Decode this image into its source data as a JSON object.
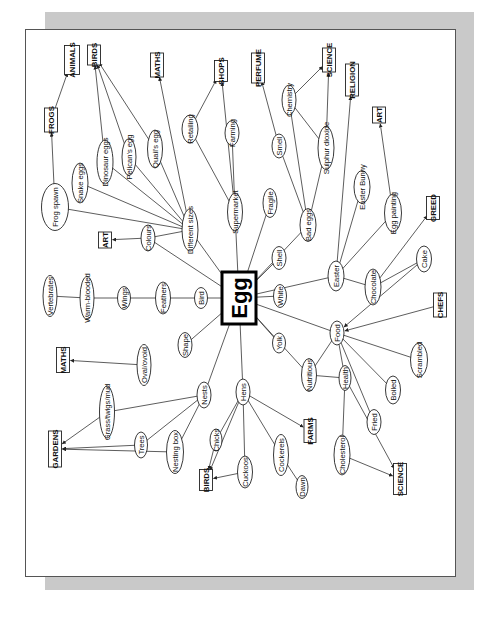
{
  "diagram": {
    "type": "mind-map",
    "orientation": "rotated-90-ccw",
    "central": {
      "id": "egg",
      "label": "Egg"
    },
    "colors": {
      "shadow": "#c9c9c9",
      "panel": "#ffffff",
      "line": "#333333",
      "ink": "#111111"
    },
    "concepts": [
      {
        "id": "frog_spawn",
        "label": "Frog spawn"
      },
      {
        "id": "snake_eggs",
        "label": "Snake eggs"
      },
      {
        "id": "dinosaur_eggs",
        "label": "Dinosaur eggs"
      },
      {
        "id": "pelicans_egg",
        "label": "Pelican's egg"
      },
      {
        "id": "quails_egg",
        "label": "Quail's egg"
      },
      {
        "id": "retailing",
        "label": "Retailing"
      },
      {
        "id": "farming",
        "label": "Farming"
      },
      {
        "id": "smell",
        "label": "Smell"
      },
      {
        "id": "chemistry",
        "label": "Chemistry"
      },
      {
        "id": "sulphur_dioxide",
        "label": "Sulphur dioxide"
      },
      {
        "id": "easter_bunny",
        "label": "Easter Bunny"
      },
      {
        "id": "egg_painting",
        "label": "Egg painting"
      },
      {
        "id": "different_sizes",
        "label": "Different sizes"
      },
      {
        "id": "supermarket",
        "label": "Supermarket"
      },
      {
        "id": "fragile",
        "label": "Fragile"
      },
      {
        "id": "bad_eggs",
        "label": "Bad eggs"
      },
      {
        "id": "colours",
        "label": "Colours"
      },
      {
        "id": "shell",
        "label": "Shell"
      },
      {
        "id": "easter",
        "label": "Easter"
      },
      {
        "id": "chocolate",
        "label": "Chocolate"
      },
      {
        "id": "cake",
        "label": "Cake"
      },
      {
        "id": "vertebrates",
        "label": "Vertebrates"
      },
      {
        "id": "warm_blooded",
        "label": "Warm-blooded"
      },
      {
        "id": "wings",
        "label": "Wings"
      },
      {
        "id": "feathers",
        "label": "Feathers"
      },
      {
        "id": "bird",
        "label": "Bird"
      },
      {
        "id": "white",
        "label": "White"
      },
      {
        "id": "shape",
        "label": "Shape"
      },
      {
        "id": "yolk",
        "label": "Yolk"
      },
      {
        "id": "food",
        "label": "Food"
      },
      {
        "id": "oval_ovoid",
        "label": "Oval/ovoid"
      },
      {
        "id": "scrambled",
        "label": "Scrambled"
      },
      {
        "id": "nutritious",
        "label": "Nutritious"
      },
      {
        "id": "health",
        "label": "Health"
      },
      {
        "id": "grass_twigs_mud",
        "label": "Grass/twigs/mud"
      },
      {
        "id": "nests",
        "label": "Nests"
      },
      {
        "id": "hens",
        "label": "Hens"
      },
      {
        "id": "boiled",
        "label": "Boiled"
      },
      {
        "id": "trees",
        "label": "Trees"
      },
      {
        "id": "chicks",
        "label": "Chicks"
      },
      {
        "id": "fried",
        "label": "Fried"
      },
      {
        "id": "nesting_box",
        "label": "Nesting box"
      },
      {
        "id": "cuckoos",
        "label": "Cuckoos"
      },
      {
        "id": "cockerels",
        "label": "Cockerels"
      },
      {
        "id": "cholesterol",
        "label": "Cholesterol"
      },
      {
        "id": "dawn",
        "label": "Dawn"
      }
    ],
    "subjects": [
      {
        "id": "frogs",
        "label": "FROGS"
      },
      {
        "id": "animals",
        "label": "ANIMALS"
      },
      {
        "id": "birds_top",
        "label": "BIRDS"
      },
      {
        "id": "maths_top",
        "label": "MATHS"
      },
      {
        "id": "shops",
        "label": "SHOPS"
      },
      {
        "id": "perfume",
        "label": "PERFUME"
      },
      {
        "id": "science_top",
        "label": "SCIENCE"
      },
      {
        "id": "religion",
        "label": "RELIGION"
      },
      {
        "id": "art_right",
        "label": "ART"
      },
      {
        "id": "art_left",
        "label": "ART"
      },
      {
        "id": "greed",
        "label": "GREED"
      },
      {
        "id": "chefs",
        "label": "CHEFS"
      },
      {
        "id": "maths_left",
        "label": "MATHS"
      },
      {
        "id": "gardens",
        "label": "GARDENS"
      },
      {
        "id": "farms",
        "label": "FARMS"
      },
      {
        "id": "birds_bottom",
        "label": "BIRDS"
      },
      {
        "id": "science_bottom",
        "label": "SCIENCE"
      }
    ],
    "connections": [
      [
        "egg",
        "different_sizes"
      ],
      [
        "egg",
        "supermarket"
      ],
      [
        "egg",
        "fragile"
      ],
      [
        "egg",
        "bad_eggs"
      ],
      [
        "egg",
        "shell"
      ],
      [
        "egg",
        "colours"
      ],
      [
        "egg",
        "bird"
      ],
      [
        "egg",
        "white"
      ],
      [
        "egg",
        "easter"
      ],
      [
        "egg",
        "shape"
      ],
      [
        "egg",
        "yolk"
      ],
      [
        "egg",
        "food"
      ],
      [
        "egg",
        "nests"
      ],
      [
        "egg",
        "hens"
      ],
      [
        "egg",
        "nutritious"
      ],
      [
        "different_sizes",
        "frog_spawn"
      ],
      [
        "different_sizes",
        "snake_eggs"
      ],
      [
        "different_sizes",
        "dinosaur_eggs"
      ],
      [
        "different_sizes",
        "pelicans_egg"
      ],
      [
        "different_sizes",
        "quails_egg"
      ],
      [
        "different_sizes",
        "colours"
      ],
      [
        "supermarket",
        "retailing"
      ],
      [
        "supermarket",
        "farming"
      ],
      [
        "bad_eggs",
        "smell"
      ],
      [
        "bad_eggs",
        "chemistry"
      ],
      [
        "bad_eggs",
        "sulphur_dioxide"
      ],
      [
        "chemistry",
        "sulphur_dioxide"
      ],
      [
        "easter",
        "easter_bunny"
      ],
      [
        "easter",
        "egg_painting"
      ],
      [
        "easter",
        "chocolate"
      ],
      [
        "chocolate",
        "cake"
      ],
      [
        "bird",
        "feathers"
      ],
      [
        "feathers",
        "wings"
      ],
      [
        "wings",
        "warm_blooded"
      ],
      [
        "warm_blooded",
        "vertebrates"
      ],
      [
        "food",
        "scrambled"
      ],
      [
        "food",
        "boiled"
      ],
      [
        "food",
        "fried"
      ],
      [
        "food",
        "health"
      ],
      [
        "food",
        "nutritious"
      ],
      [
        "nutritious",
        "health"
      ],
      [
        "health",
        "cholesterol"
      ],
      [
        "nests",
        "grass_twigs_mud"
      ],
      [
        "nests",
        "trees"
      ],
      [
        "nests",
        "nesting_box"
      ],
      [
        "hens",
        "chicks"
      ],
      [
        "hens",
        "cockerels"
      ],
      [
        "hens",
        "cuckoos"
      ],
      [
        "cockerels",
        "dawn"
      ]
    ],
    "arrows": [
      [
        "frog_spawn",
        "frogs"
      ],
      [
        "frogs",
        "animals"
      ],
      [
        "dinosaur_eggs",
        "birds_top"
      ],
      [
        "pelicans_egg",
        "birds_top"
      ],
      [
        "quails_egg",
        "birds_top"
      ],
      [
        "different_sizes",
        "maths_top"
      ],
      [
        "retailing",
        "shops"
      ],
      [
        "supermarket",
        "shops"
      ],
      [
        "smell",
        "perfume"
      ],
      [
        "chemistry",
        "science_top"
      ],
      [
        "sulphur_dioxide",
        "science_top"
      ],
      [
        "easter",
        "religion"
      ],
      [
        "egg_painting",
        "art_right"
      ],
      [
        "colours",
        "art_left"
      ],
      [
        "chocolate",
        "greed"
      ],
      [
        "cake",
        "food"
      ],
      [
        "chefs",
        "food"
      ],
      [
        "oval_ovoid",
        "maths_left"
      ],
      [
        "grass_twigs_mud",
        "gardens"
      ],
      [
        "trees",
        "gardens"
      ],
      [
        "nesting_box",
        "gardens"
      ],
      [
        "hens",
        "farms"
      ],
      [
        "chicks",
        "birds_bottom"
      ],
      [
        "cuckoos",
        "birds_bottom"
      ],
      [
        "hens",
        "birds_bottom"
      ],
      [
        "health",
        "science_bottom"
      ],
      [
        "cholesterol",
        "science_bottom"
      ]
    ]
  }
}
